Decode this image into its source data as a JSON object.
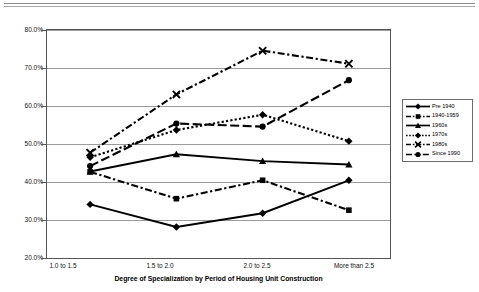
{
  "chart_data": {
    "type": "line",
    "title": "",
    "xlabel": "Degree of Specialization by Period of Housing Unit Construction",
    "ylabel": "",
    "categories": [
      "1.0 to 1.5",
      "1.5 to 2.0",
      "2.0 to 2.5",
      "More than 2.5"
    ],
    "ylim": [
      20,
      80
    ],
    "ytick_labels": [
      "80.0%",
      "70.0%",
      "60.0%",
      "50.0%",
      "40.0%",
      "30.0%",
      "20.0%"
    ],
    "ytick_values": [
      80,
      70,
      60,
      50,
      40,
      30,
      20
    ],
    "grid": true,
    "legend_position": "right",
    "series": [
      {
        "name": "Pre 1940",
        "marker": "diamond",
        "dash": "solid",
        "values": [
          34.5,
          28.6,
          32.2,
          40.8
        ]
      },
      {
        "name": "1940-1959",
        "marker": "square",
        "dash": "dash-dot",
        "values": [
          43.0,
          36.0,
          40.8,
          33.0
        ]
      },
      {
        "name": "1960s",
        "marker": "triangle",
        "dash": "solid",
        "values": [
          43.1,
          47.6,
          45.8,
          44.9
        ]
      },
      {
        "name": "1970s",
        "marker": "diamond",
        "dash": "dotted",
        "values": [
          46.8,
          53.9,
          57.9,
          51.0
        ]
      },
      {
        "name": "1980s",
        "marker": "x",
        "dash": "dash-dot",
        "values": [
          48.0,
          63.2,
          74.6,
          71.2
        ]
      },
      {
        "name": "Since 1990",
        "marker": "circle",
        "dash": "long-dash",
        "values": [
          44.5,
          55.6,
          54.8,
          66.9
        ]
      }
    ],
    "point_labels": {
      "1970s": [
        52.8,
        53.9,
        59.5,
        51.0
      ]
    }
  },
  "colors": {
    "line": "#000000",
    "grid": "#9b9b9b",
    "frame": "#555555",
    "background": "#ffffff"
  }
}
